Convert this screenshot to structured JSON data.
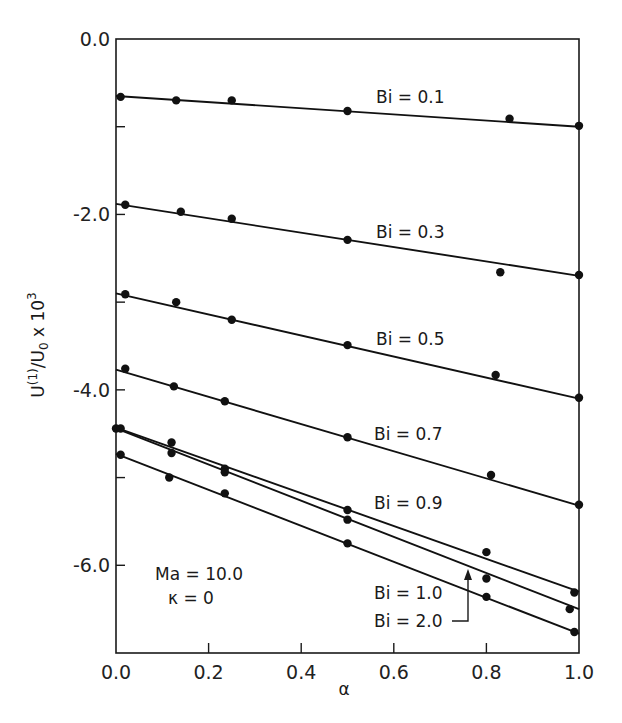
{
  "chart_data": {
    "type": "line",
    "title": "",
    "xlabel": "α",
    "ylabel": "U(1)/U0 x 10^3",
    "ylabel_parts": {
      "main": "U",
      "sup1": "(1)",
      "mid": "/U",
      "sub": "0",
      "tail": " x 10",
      "sup2": "3"
    },
    "xlim": [
      0.0,
      1.0
    ],
    "ylim": [
      -7.0,
      0.0
    ],
    "grid": false,
    "legend_position": "inline labels",
    "x_ticks": [
      0.0,
      0.2,
      0.4,
      0.6,
      0.8,
      1.0
    ],
    "x_tick_labels": [
      "0.0",
      "0.2",
      "0.4",
      "0.6",
      "0.8",
      "1.0"
    ],
    "y_ticks": [
      0.0,
      -1.0,
      -2.0,
      -3.0,
      -4.0,
      -5.0,
      -6.0,
      -7.0
    ],
    "y_tick_labels": [
      "0.0",
      "",
      "-2.0",
      "",
      "-4.0",
      "",
      "-6.0",
      ""
    ],
    "annotations": [
      "Ma = 10.0",
      "κ = 0"
    ],
    "series": [
      {
        "name": "Bi = 0.1",
        "fit": [
          [
            0.0,
            -0.65
          ],
          [
            1.0,
            -1.0
          ]
        ],
        "points": [
          [
            0.01,
            -0.66
          ],
          [
            0.13,
            -0.7
          ],
          [
            0.25,
            -0.7
          ],
          [
            0.5,
            -0.82
          ],
          [
            0.85,
            -0.91
          ],
          [
            1.0,
            -0.99
          ]
        ]
      },
      {
        "name": "Bi = 0.3",
        "fit": [
          [
            0.0,
            -1.88
          ],
          [
            1.0,
            -2.7
          ]
        ],
        "points": [
          [
            0.02,
            -1.89
          ],
          [
            0.14,
            -1.97
          ],
          [
            0.25,
            -2.05
          ],
          [
            0.5,
            -2.29
          ],
          [
            0.83,
            -2.66
          ],
          [
            1.0,
            -2.69
          ]
        ]
      },
      {
        "name": "Bi = 0.5",
        "fit": [
          [
            0.0,
            -2.9
          ],
          [
            1.0,
            -4.1
          ]
        ],
        "points": [
          [
            0.02,
            -2.91
          ],
          [
            0.13,
            -3.0
          ],
          [
            0.25,
            -3.2
          ],
          [
            0.5,
            -3.49
          ],
          [
            0.82,
            -3.83
          ],
          [
            1.0,
            -4.09
          ]
        ]
      },
      {
        "name": "Bi = 0.7",
        "fit": [
          [
            0.0,
            -3.77
          ],
          [
            1.0,
            -5.32
          ]
        ],
        "points": [
          [
            0.02,
            -3.76
          ],
          [
            0.125,
            -3.96
          ],
          [
            0.235,
            -4.13
          ],
          [
            0.5,
            -4.54
          ],
          [
            0.81,
            -4.97
          ],
          [
            1.0,
            -5.31
          ]
        ]
      },
      {
        "name": "Bi = 0.9",
        "fit": [
          [
            0.0,
            -4.43
          ],
          [
            1.0,
            -6.3
          ]
        ],
        "points": [
          [
            0.0,
            -4.44
          ],
          [
            0.12,
            -4.6
          ],
          [
            0.235,
            -4.9
          ],
          [
            0.5,
            -5.37
          ],
          [
            0.8,
            -5.85
          ],
          [
            0.99,
            -6.31
          ]
        ]
      },
      {
        "name": "Bi = 2.0",
        "fit": [
          [
            0.0,
            -4.44
          ],
          [
            1.0,
            -6.5
          ]
        ],
        "points": [
          [
            0.01,
            -4.44
          ],
          [
            0.12,
            -4.72
          ],
          [
            0.235,
            -4.94
          ],
          [
            0.5,
            -5.48
          ],
          [
            0.8,
            -6.15
          ],
          [
            0.98,
            -6.5
          ]
        ]
      },
      {
        "name": "Bi = 1.0",
        "fit": [
          [
            0.0,
            -4.73
          ],
          [
            1.0,
            -6.78
          ]
        ],
        "points": [
          [
            0.01,
            -4.74
          ],
          [
            0.115,
            -5.0
          ],
          [
            0.235,
            -5.18
          ],
          [
            0.5,
            -5.75
          ],
          [
            0.8,
            -6.36
          ],
          [
            0.99,
            -6.76
          ]
        ]
      }
    ],
    "series_label_positions": {
      "Bi = 0.1": [
        376,
        103
      ],
      "Bi = 0.3": [
        376,
        238
      ],
      "Bi = 0.5": [
        376,
        345
      ],
      "Bi = 0.7": [
        374,
        440
      ],
      "Bi = 0.9": [
        374,
        509
      ],
      "Bi = 1.0": [
        374,
        599
      ],
      "Bi = 2.0": [
        374,
        627
      ]
    }
  }
}
